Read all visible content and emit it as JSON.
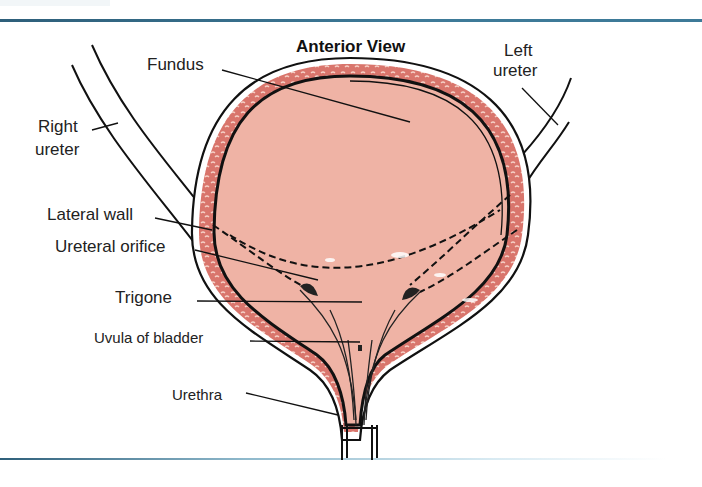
{
  "figure": {
    "title": "Anterior View",
    "colors": {
      "rule": "#3a6f8a",
      "bladder_fill": "#efb3a5",
      "wall_muscle": "#d9756c",
      "outline": "#111111"
    }
  },
  "labels": {
    "fundus": "Fundus",
    "left_ureter_line1": "Left",
    "left_ureter_line2": "ureter",
    "right_ureter_line1": "Right",
    "right_ureter_line2": "ureter",
    "lateral_wall": "Lateral wall",
    "ureteral_orifice": "Ureteral orifice",
    "trigone": "Trigone",
    "uvula_of_bladder": "Uvula of bladder",
    "urethra": "Urethra"
  }
}
